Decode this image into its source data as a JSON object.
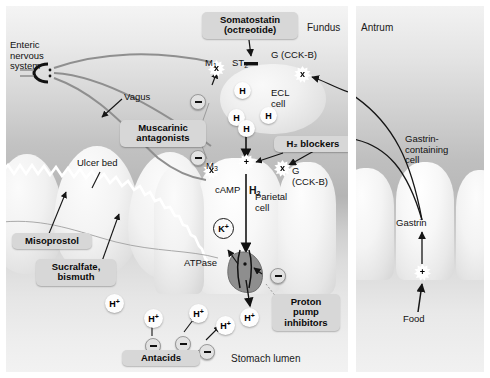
{
  "diagram": {
    "panels": {
      "fundus": {
        "region_label": "Fundus",
        "lumen_label": "Stomach lumen"
      },
      "antrum": {
        "region_label": "Antrum"
      }
    }
  },
  "fundus": {
    "labels": {
      "enteric_nervous_system": "Enteric\nnervous\nsystem",
      "vagus": "Vagus",
      "ulcer_bed": "Ulcer bed",
      "ecl_cell": "ECL\ncell",
      "parietal_cell": "Parietal\ncell",
      "camp": "cAMP",
      "atpase": "ATPase",
      "region": "Fundus",
      "lumen": "Stomach lumen"
    },
    "receptors": {
      "m1": "M",
      "m1_sub": "1",
      "m3": "M",
      "m3_sub": "3",
      "st2": "ST",
      "st2_sub": "2",
      "g_cckb_ecl": "G (CCK-B)",
      "g_cckb_parietal": "G\n(CCK-B)",
      "h2": "H",
      "h2_sub": "2"
    },
    "tokens": {
      "receptor_x": "x",
      "plus": "+",
      "histamine": "H",
      "proton": "H",
      "proton_sup": "+",
      "potassium": "K",
      "potassium_sup": "+"
    },
    "callouts": [
      {
        "name": "somatostatin",
        "text": "Somatostatin\n(octreotide)"
      },
      {
        "name": "muscarinic-antagonists",
        "text": "Muscarinic\nantagonists"
      },
      {
        "name": "h2-blockers",
        "text": "H₂ blockers"
      },
      {
        "name": "misoprostol",
        "text": "Misoprostol"
      },
      {
        "name": "sucralfate-bismuth",
        "text": "Sucralfate,\nbismuth"
      },
      {
        "name": "antacids",
        "text": "Antacids"
      },
      {
        "name": "proton-pump-inhibitors",
        "text": "Proton\npump\ninhibitors"
      }
    ]
  },
  "antrum": {
    "labels": {
      "region": "Antrum",
      "gastrin_containing_cell": "Gastrin-\ncontaining\ncell",
      "gastrin": "Gastrin",
      "food": "Food"
    },
    "tokens": {
      "plus": "+"
    }
  },
  "colors": {
    "callout_bg": "#d7d7d7",
    "text": "#111111",
    "mucus_line": "#ffffff",
    "nerve": "#8a8a8a",
    "arrow": "#151515"
  }
}
